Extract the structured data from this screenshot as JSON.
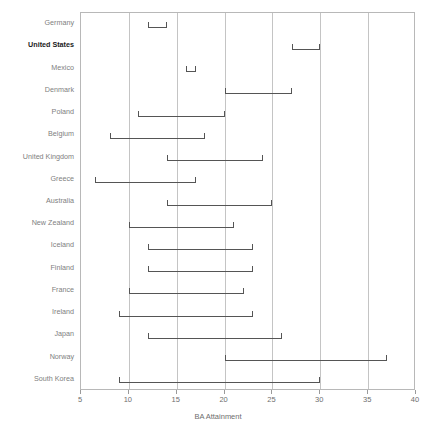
{
  "chart_data": {
    "type": "bar",
    "subtype": "range-bar-horizontal",
    "title": "",
    "xlabel": "BA Attainment",
    "ylabel": "",
    "xlim": [
      5,
      40
    ],
    "ylim": null,
    "grid": "vertical",
    "legend": "none",
    "xticks": [
      5,
      10,
      15,
      20,
      25,
      30,
      35,
      40
    ],
    "xticklabels": [
      "5",
      "10",
      "15",
      "20",
      "25",
      "30",
      "35",
      "40"
    ],
    "categories": [
      "Germany",
      "United States",
      "Mexico",
      "Denmark",
      "Poland",
      "Belgium",
      "United Kingdom",
      "Greece",
      "Australia",
      "New Zealand",
      "Iceland",
      "Finland",
      "France",
      "Ireland",
      "Japan",
      "Norway",
      "South Korea"
    ],
    "highlight_category": "United States",
    "series": [
      {
        "name": "low",
        "values": [
          12,
          27,
          16,
          20,
          11,
          8,
          14,
          6.5,
          14,
          10,
          12,
          12,
          10,
          9,
          12,
          20,
          9
        ]
      },
      {
        "name": "high",
        "values": [
          14,
          30,
          17,
          27,
          20,
          18,
          24,
          17,
          25,
          21,
          23,
          23,
          22,
          23,
          26,
          37,
          30
        ]
      }
    ],
    "bars": [
      {
        "category": "Germany",
        "low": 12,
        "high": 14
      },
      {
        "category": "United States",
        "low": 27,
        "high": 30
      },
      {
        "category": "Mexico",
        "low": 16,
        "high": 17
      },
      {
        "category": "Denmark",
        "low": 20,
        "high": 27
      },
      {
        "category": "Poland",
        "low": 11,
        "high": 20
      },
      {
        "category": "Belgium",
        "low": 8,
        "high": 18
      },
      {
        "category": "United Kingdom",
        "low": 14,
        "high": 24
      },
      {
        "category": "Greece",
        "low": 6.5,
        "high": 17
      },
      {
        "category": "Australia",
        "low": 14,
        "high": 25
      },
      {
        "category": "New Zealand",
        "low": 10,
        "high": 21
      },
      {
        "category": "Iceland",
        "low": 12,
        "high": 23
      },
      {
        "category": "Finland",
        "low": 12,
        "high": 23
      },
      {
        "category": "France",
        "low": 10,
        "high": 22
      },
      {
        "category": "Ireland",
        "low": 9,
        "high": 23
      },
      {
        "category": "Japan",
        "low": 12,
        "high": 26
      },
      {
        "category": "Norway",
        "low": 20,
        "high": 37
      },
      {
        "category": "South Korea",
        "low": 9,
        "high": 30
      }
    ],
    "colors": {
      "bar": "#555555",
      "gridline": "#c4c4c4",
      "plot_border": "#b8b8b8",
      "label": "#808080",
      "highlight_label": "#1a1a1a",
      "background": "#ffffff"
    }
  }
}
